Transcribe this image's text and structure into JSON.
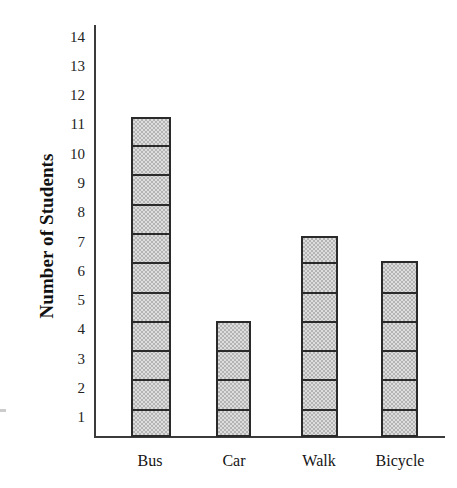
{
  "chart_data": {
    "type": "bar",
    "title": "",
    "xlabel": "",
    "ylabel": "Number of Students",
    "categories": [
      "Bus",
      "Car",
      "Walk",
      "Bicycle"
    ],
    "values": [
      11,
      4,
      7,
      6
    ],
    "bar_top_values": [
      11.4,
      4.7,
      7.7,
      6.8
    ],
    "segments": [
      11,
      4,
      7,
      6
    ],
    "ylim": [
      0,
      14
    ],
    "y_tick_labels": [
      "14",
      "13",
      "12",
      "11",
      "10",
      "9",
      "8",
      "7",
      "6",
      "5",
      "4",
      "3",
      "2",
      "1"
    ],
    "y_tick_values": [
      14,
      13,
      12,
      11,
      10,
      9,
      8,
      7,
      6,
      5,
      4,
      3,
      2,
      1
    ],
    "grid": false,
    "legend": false,
    "bar_fill_color": "#b4b4b4",
    "bar_outline_color": "#2a2a2a",
    "axis_color": "#3b3b3b",
    "background_color": "#ffffff"
  },
  "axes": {
    "y_title": "Number of Students",
    "y_ticks": [
      {
        "label": "14",
        "y": 38
      },
      {
        "label": "13",
        "y": 67
      },
      {
        "label": "12",
        "y": 96
      },
      {
        "label": "11",
        "y": 125
      },
      {
        "label": "10",
        "y": 155
      },
      {
        "label": "9",
        "y": 184
      },
      {
        "label": "8",
        "y": 213
      },
      {
        "label": "7",
        "y": 243
      },
      {
        "label": "6",
        "y": 272
      },
      {
        "label": "5",
        "y": 301
      },
      {
        "label": "4",
        "y": 330
      },
      {
        "label": "3",
        "y": 360
      },
      {
        "label": "2",
        "y": 389
      },
      {
        "label": "1",
        "y": 418
      }
    ],
    "x_ticks": [
      {
        "label": "Bus",
        "center": 150
      },
      {
        "label": "Car",
        "center": 234
      },
      {
        "label": "Walk",
        "center": 319
      },
      {
        "label": "Bicycle",
        "center": 400
      }
    ]
  },
  "bars": [
    {
      "name": "Bus",
      "left": 131,
      "width": 40,
      "top": 117,
      "height": 320,
      "segments": 11
    },
    {
      "name": "Car",
      "left": 216,
      "width": 35,
      "top": 321,
      "height": 116,
      "segments": 4
    },
    {
      "name": "Walk",
      "left": 301,
      "width": 37,
      "top": 236,
      "height": 201,
      "segments": 7
    },
    {
      "name": "Bicycle",
      "left": 381,
      "width": 37,
      "top": 261,
      "height": 176,
      "segments": 6
    }
  ]
}
